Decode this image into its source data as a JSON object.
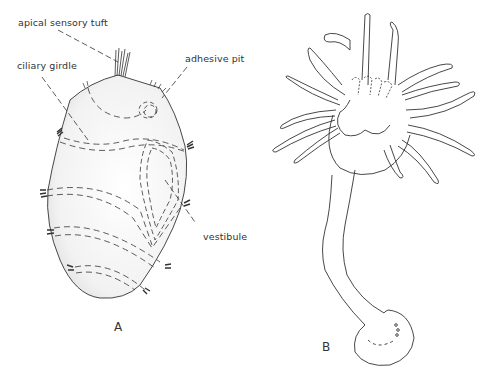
{
  "figure": {
    "panels": [
      {
        "id": "A",
        "letter": "A",
        "description": "larva with ciliary girdles",
        "labels": {
          "apical_sensory_tuft": "apical sensory tuft",
          "ciliary_girdle": "ciliary girdle",
          "adhesive_pit": "adhesive pit",
          "vestibule": "vestibule"
        }
      },
      {
        "id": "B",
        "letter": "B",
        "description": "stalked polyp with tentacles"
      }
    ],
    "colors": {
      "line": "#333333",
      "background": "#ffffff",
      "shading": "#d8d8d8"
    }
  }
}
